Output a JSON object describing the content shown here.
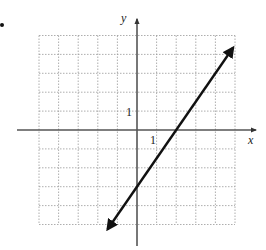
{
  "chart_data": {
    "type": "line",
    "title": "",
    "xlabel": "x",
    "ylabel": "y",
    "xlim": [
      -5,
      5
    ],
    "ylim": [
      -5,
      5
    ],
    "grid": true,
    "tick_labels": {
      "x": [
        "1"
      ],
      "y": [
        "1"
      ]
    },
    "series": [
      {
        "name": "line",
        "equation": "y = 1.5x - 3",
        "x": [
          -1.5,
          0,
          2,
          4.9
        ],
        "y": [
          -5.25,
          -3,
          0,
          4.35
        ],
        "arrows": "both"
      }
    ]
  },
  "labels": {
    "x_axis": "x",
    "y_axis": "y",
    "x_tick": "1",
    "y_tick": "1",
    "bullet": "•"
  }
}
